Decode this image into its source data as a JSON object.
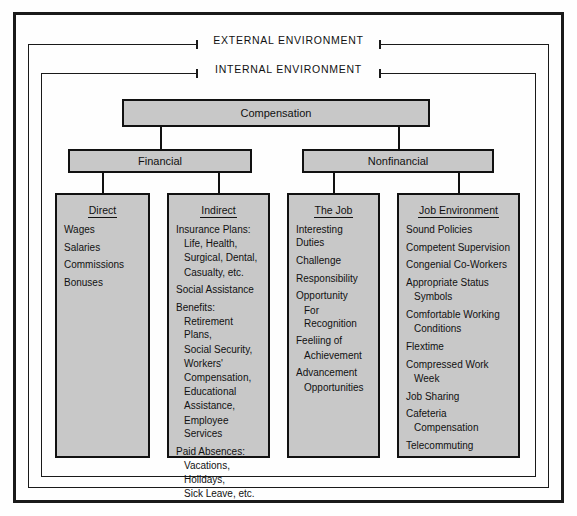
{
  "frames": {
    "external_label": "EXTERNAL ENVIRONMENT",
    "internal_label": "INTERNAL ENVIRONMENT"
  },
  "colors": {
    "box_fill": "#c8c8c8",
    "border": "#111111",
    "page_background": "#fefefe"
  },
  "hierarchy": {
    "root": "Compensation",
    "level2": [
      "Financial",
      "Nonfinancial"
    ],
    "level3": [
      "Direct",
      "Indirect",
      "The Job",
      "Job Environment"
    ]
  },
  "columns": [
    {
      "header": "Direct",
      "items": [
        {
          "text": "Wages",
          "indent": false
        },
        {
          "text": "Salaries",
          "indent": false
        },
        {
          "text": "Commissions",
          "indent": false
        },
        {
          "text": "Bonuses",
          "indent": false
        }
      ]
    },
    {
      "header": "Indirect",
      "items": [
        {
          "text": "Insurance Plans:",
          "indent": false
        },
        {
          "text": "Life, Health,",
          "indent": true
        },
        {
          "text": "Surgical, Dental,",
          "indent": true
        },
        {
          "text": "Casualty, etc.",
          "indent": true
        },
        {
          "text": "Social Assistance",
          "indent": false
        },
        {
          "text": "Benefits:",
          "indent": false
        },
        {
          "text": "Retirement Plans,",
          "indent": true
        },
        {
          "text": "Social Security,",
          "indent": true
        },
        {
          "text": "Workers'",
          "indent": true
        },
        {
          "text": "Compensation,",
          "indent": true
        },
        {
          "text": "Educational",
          "indent": true
        },
        {
          "text": "Assistance,",
          "indent": true
        },
        {
          "text": "Employee Services",
          "indent": true
        },
        {
          "text": "Paid Absences:",
          "indent": false
        },
        {
          "text": "Vacations,",
          "indent": true
        },
        {
          "text": "Holidays,",
          "indent": true
        },
        {
          "text": "Sick Leave, etc.",
          "indent": true
        }
      ]
    },
    {
      "header": "The Job",
      "items": [
        {
          "text": "Interesting Duties",
          "indent": false
        },
        {
          "text": "Challenge",
          "indent": false
        },
        {
          "text": "Responsibility",
          "indent": false
        },
        {
          "text": "Opportunity",
          "indent": false
        },
        {
          "text": "For Recognition",
          "indent": true
        },
        {
          "text": "Feeliing of",
          "indent": false
        },
        {
          "text": "Achievement",
          "indent": true
        },
        {
          "text": "Advancement",
          "indent": false
        },
        {
          "text": "Opportunities",
          "indent": true
        }
      ]
    },
    {
      "header": "Job Environment",
      "items": [
        {
          "text": "Sound Policies",
          "indent": false
        },
        {
          "text": "Competent Supervision",
          "indent": false
        },
        {
          "text": "Congenial Co-Workers",
          "indent": false
        },
        {
          "text": "Appropriate Status",
          "indent": false
        },
        {
          "text": "Symbols",
          "indent": true
        },
        {
          "text": "Comfortable Working",
          "indent": false
        },
        {
          "text": "Conditions",
          "indent": true
        },
        {
          "text": "Flextime",
          "indent": false
        },
        {
          "text": "Compressed Work",
          "indent": false
        },
        {
          "text": "Week",
          "indent": true
        },
        {
          "text": "Job Sharing",
          "indent": false
        },
        {
          "text": "Cafeteria",
          "indent": false
        },
        {
          "text": "Compensation",
          "indent": true
        },
        {
          "text": "Telecommuting",
          "indent": false
        }
      ]
    }
  ]
}
